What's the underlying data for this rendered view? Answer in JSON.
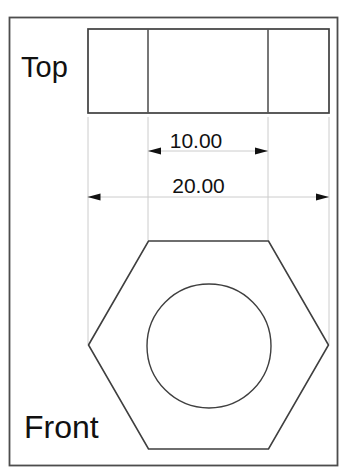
{
  "labels": {
    "top_view": "Top",
    "front_view": "Front"
  },
  "dimensions": {
    "across_flats": "10.00",
    "across_corners": "20.00"
  },
  "colors": {
    "background": "#ffffff",
    "frame": "#4d4d4d",
    "outline": "#3f3f3f",
    "edge_line": "#555555",
    "extension_line": "#cccccc",
    "arrow": "#111111",
    "text": "#111111"
  }
}
